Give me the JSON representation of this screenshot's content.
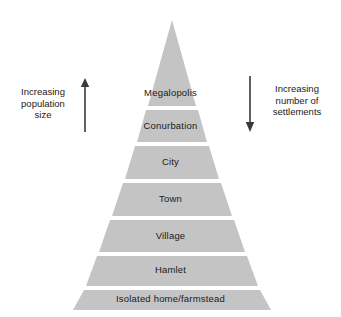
{
  "diagram": {
    "type": "pyramid",
    "fill_color": "#c4c4c4",
    "divider_color": "#ffffff",
    "text_color": "#1a1a1a",
    "background_color": "#ffffff"
  },
  "pyramid": {
    "tiers": [
      {
        "label": "Megalopolis",
        "rank": 1
      },
      {
        "label": "Conurbation",
        "rank": 2
      },
      {
        "label": "City",
        "rank": 3
      },
      {
        "label": "Town",
        "rank": 4
      },
      {
        "label": "Village",
        "rank": 5
      },
      {
        "label": "Hamlet",
        "rank": 6
      },
      {
        "label": "Isolated home/farmstead",
        "rank": 7
      }
    ]
  },
  "annotations": {
    "left": {
      "line1": "Increasing",
      "line2": "population",
      "line3": "size",
      "arrow": "arrow-up"
    },
    "right": {
      "line1": "Increasing",
      "line2": "number of",
      "line3": "settlements",
      "arrow": "arrow-down"
    }
  }
}
